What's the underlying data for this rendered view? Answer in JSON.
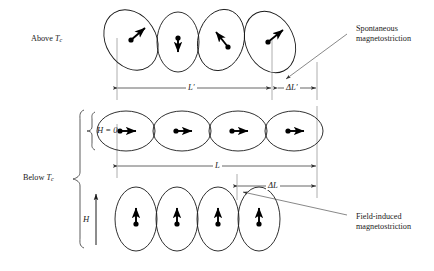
{
  "figure": {
    "background_color": "#ffffff",
    "ink_color": "#1a1a1a",
    "guide_color": "#999999",
    "width": 434,
    "height": 271
  },
  "labels": {
    "above_tc_prefix": "Above ",
    "above_tc_symbol": "T",
    "above_tc_sub": "c",
    "below_tc_prefix": "Below ",
    "below_tc_symbol": "T",
    "below_tc_sub": "c",
    "h_zero": "H = 0",
    "h_field": "H"
  },
  "dimensions": {
    "l_prime": "L′",
    "delta_l_prime": "ΔL′",
    "l": "L",
    "delta_l": "ΔL"
  },
  "annotations": [
    {
      "id": "spontaneous",
      "line1": "Spontaneous",
      "line2": "magnetostriction",
      "x": 356,
      "y": 24
    },
    {
      "id": "field-induced",
      "line1": "Field-induced",
      "line2": "magnetostriction",
      "x": 356,
      "y": 212
    }
  ],
  "rows": [
    {
      "id": "above-tc",
      "description": "Randomly oriented distorted domains above the Curie temperature",
      "domain_count": 4,
      "domains": [
        {
          "cx": 131,
          "cy": 40,
          "rx": 25,
          "ry": 32,
          "rotate": -32,
          "moment_angle_deg": -38,
          "moment_label": "up-right"
        },
        {
          "cx": 178,
          "cy": 42,
          "rx": 21,
          "ry": 30,
          "rotate": 0,
          "moment_angle_deg": 90,
          "moment_label": "down"
        },
        {
          "cx": 221,
          "cy": 40,
          "rx": 23,
          "ry": 31,
          "rotate": 14,
          "moment_angle_deg": -125,
          "moment_label": "up-left"
        },
        {
          "cx": 270,
          "cy": 42,
          "rx": 24,
          "ry": 32,
          "rotate": -25,
          "moment_angle_deg": -35,
          "moment_label": "up-right"
        }
      ]
    },
    {
      "id": "h-zero",
      "description": "Aligned domains at zero applied field below the Curie temperature",
      "domain_count": 4,
      "domains": [
        {
          "cx": 126,
          "cy": 131,
          "rx": 29,
          "ry": 20,
          "rotate": 0,
          "moment_angle_deg": 0,
          "moment_label": "right"
        },
        {
          "cx": 182,
          "cy": 131,
          "rx": 29,
          "ry": 20,
          "rotate": 0,
          "moment_angle_deg": 0,
          "moment_label": "right"
        },
        {
          "cx": 238,
          "cy": 131,
          "rx": 29,
          "ry": 20,
          "rotate": 0,
          "moment_angle_deg": 0,
          "moment_label": "right"
        },
        {
          "cx": 294,
          "cy": 131,
          "rx": 29,
          "ry": 20,
          "rotate": 0,
          "moment_angle_deg": 0,
          "moment_label": "right"
        }
      ]
    },
    {
      "id": "h-applied",
      "description": "Domains elongated along the applied field direction",
      "domain_count": 4,
      "domains": [
        {
          "cx": 136,
          "cy": 219,
          "rx": 21,
          "ry": 32,
          "rotate": 0,
          "moment_angle_deg": -90,
          "moment_label": "up"
        },
        {
          "cx": 177,
          "cy": 219,
          "rx": 21,
          "ry": 32,
          "rotate": 0,
          "moment_angle_deg": -90,
          "moment_label": "up"
        },
        {
          "cx": 218,
          "cy": 219,
          "rx": 21,
          "ry": 32,
          "rotate": 0,
          "moment_angle_deg": -90,
          "moment_label": "up"
        },
        {
          "cx": 259,
          "cy": 219,
          "rx": 21,
          "ry": 32,
          "rotate": 0,
          "moment_angle_deg": -90,
          "moment_label": "up"
        }
      ]
    }
  ],
  "measure_lines": [
    {
      "id": "l-prime-measure",
      "x1": 117,
      "x2": 272,
      "y": 88,
      "label": "L′"
    },
    {
      "id": "delta-l-prime-measure",
      "x1": 277,
      "x2": 317,
      "y": 88,
      "label": "ΔL′"
    },
    {
      "id": "l-measure",
      "x1": 117,
      "x2": 317,
      "y": 166,
      "label": "L"
    },
    {
      "id": "delta-l-measure",
      "x1": 237,
      "x2": 317,
      "y": 186,
      "label": "ΔL"
    }
  ],
  "guides": [
    {
      "id": "guide-left-top",
      "x": 117,
      "y1": 40,
      "y2": 100
    },
    {
      "id": "guide-mid-top",
      "x": 272,
      "y1": 40,
      "y2": 100
    },
    {
      "id": "guide-right-top",
      "x": 317,
      "y1": 64,
      "y2": 100
    },
    {
      "id": "guide-left-bottom",
      "x": 117,
      "y1": 125,
      "y2": 176
    },
    {
      "id": "guide-delta-bottom",
      "x": 237,
      "y1": 176,
      "y2": 200
    },
    {
      "id": "guide-right-bottom",
      "x": 317,
      "y1": 108,
      "y2": 198
    }
  ],
  "brackets": [
    {
      "id": "below-tc-bracket",
      "x": 80,
      "y_top": 110,
      "y_bottom": 248,
      "tip_x": 72,
      "tip_y": 179
    },
    {
      "id": "h-zero-bracket",
      "x": 92,
      "y_top": 112,
      "y_bottom": 150,
      "tip_x": 86,
      "tip_y": 131
    }
  ],
  "field_arrow": {
    "id": "h-field-arrow",
    "x": 96,
    "y1": 245,
    "y2": 192
  }
}
